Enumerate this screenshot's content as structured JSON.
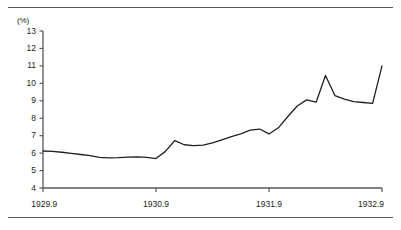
{
  "figure": {
    "unit_label": "(%)",
    "rule_color": "#58595b",
    "axis_color": "#58595b",
    "line_color": "#231f20"
  },
  "chart_data": {
    "type": "line",
    "title": "",
    "subtitle": "",
    "xlabel": "",
    "ylabel": "(%)",
    "ylim": [
      4,
      13
    ],
    "xlim": [
      1929.75,
      1932.75
    ],
    "grid": false,
    "legend": false,
    "yticks": [
      4,
      5,
      6,
      7,
      8,
      9,
      10,
      11,
      12,
      13
    ],
    "ytick_labels": [
      "4",
      "5",
      "6",
      "7",
      "8",
      "9",
      "10",
      "11",
      "12",
      "13"
    ],
    "xticks": [
      1929.75,
      1930.75,
      1931.75,
      1932.75
    ],
    "xtick_labels": [
      "1929.9",
      "1930.9",
      "1931.9",
      "1932.9"
    ],
    "series": [
      {
        "name": "rate",
        "x": [
          1929.75,
          1929.833,
          1929.917,
          1930.0,
          1930.083,
          1930.167,
          1930.25,
          1930.333,
          1930.417,
          1930.5,
          1930.583,
          1930.667,
          1930.75,
          1930.833,
          1930.917,
          1931.0,
          1931.083,
          1931.167,
          1931.25,
          1931.333,
          1931.417,
          1931.5,
          1931.583,
          1931.667,
          1931.75,
          1931.833,
          1931.917,
          1932.0,
          1932.083,
          1932.167,
          1932.25,
          1932.333,
          1932.417,
          1932.5,
          1932.583,
          1932.667,
          1932.75
        ],
        "values": [
          6.12,
          6.1,
          6.05,
          5.98,
          5.92,
          5.85,
          5.76,
          5.73,
          5.74,
          5.77,
          5.78,
          5.76,
          5.69,
          6.1,
          6.72,
          6.48,
          6.43,
          6.46,
          6.58,
          6.76,
          6.95,
          7.1,
          7.32,
          7.38,
          7.1,
          7.45,
          8.1,
          8.7,
          9.05,
          8.92,
          10.45,
          9.3,
          9.1,
          8.95,
          8.9,
          8.85,
          11.0
        ]
      }
    ],
    "annotations": []
  }
}
